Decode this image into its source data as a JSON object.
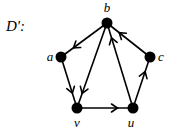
{
  "title": "D':",
  "nodes": [
    {
      "id": "b",
      "label": "b",
      "x": 107,
      "y": 23,
      "lx": 107,
      "ly": 12
    },
    {
      "id": "a",
      "label": "a",
      "x": 61,
      "y": 57,
      "lx": 50,
      "ly": 61
    },
    {
      "id": "c",
      "label": "c",
      "x": 150,
      "y": 57,
      "lx": 161,
      "ly": 61
    },
    {
      "id": "v",
      "label": "v",
      "x": 77,
      "y": 108,
      "lx": 77,
      "ly": 127
    },
    {
      "id": "u",
      "label": "u",
      "x": 133,
      "y": 108,
      "lx": 131,
      "ly": 127
    }
  ],
  "edges": [
    {
      "from": "b",
      "to": "a"
    },
    {
      "from": "b",
      "to": "v"
    },
    {
      "from": "a",
      "to": "v"
    },
    {
      "from": "v",
      "to": "u"
    },
    {
      "from": "u",
      "to": "b"
    },
    {
      "from": "u",
      "to": "c"
    },
    {
      "from": "c",
      "to": "b"
    }
  ],
  "colors": {
    "node": "#000000",
    "edge": "#000000",
    "background": "#ffffff"
  }
}
